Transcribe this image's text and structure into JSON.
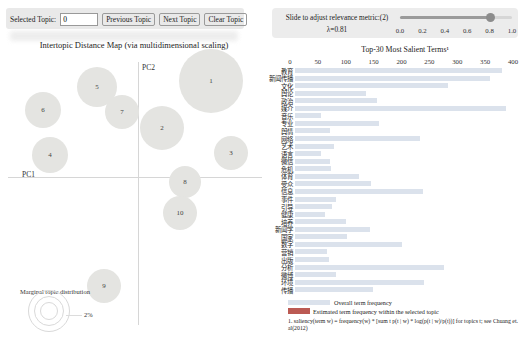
{
  "controls": {
    "selected_topic_label": "Selected Topic:",
    "selected_topic_value": "0",
    "prev_label": "Previous Topic",
    "next_label": "Next Topic",
    "clear_label": "Clear Topic"
  },
  "relevance": {
    "label": "Slide to adjust relevance metric:(2)",
    "lambda": "λ=0.81",
    "value": 0.81,
    "ticks": [
      "0.0",
      "0.2",
      "0.4",
      "0.6",
      "0.8",
      "1.0"
    ]
  },
  "legend": {
    "overall": "Overall term frequency",
    "selected": "Estimated term frequency within the selected topic",
    "overall_color": "#dbe2ec",
    "selected_color": "#bb5a53"
  },
  "footnote": "1. saliency(term w) = frequency(w) * [sum t p(t | w) * log(p(t | w)/p(t))] for topics t; see Chuang et. al(2012)",
  "chart_data": [
    {
      "type": "scatter",
      "title": "Intertopic Distance Map (via multidimensional scaling)",
      "xlabel": "PC1",
      "ylabel": "PC2",
      "marginal_legend_label": "Marginal topic distribution",
      "marginal_legend_tick": "2%",
      "points": [
        {
          "topic": 1,
          "cx": 211,
          "cy": 81,
          "r": 32
        },
        {
          "topic": 2,
          "cx": 162,
          "cy": 128,
          "r": 22
        },
        {
          "topic": 3,
          "cx": 231,
          "cy": 153,
          "r": 17
        },
        {
          "topic": 4,
          "cx": 50,
          "cy": 155,
          "r": 18
        },
        {
          "topic": 5,
          "cx": 97,
          "cy": 87,
          "r": 20
        },
        {
          "topic": 6,
          "cx": 43,
          "cy": 110,
          "r": 18
        },
        {
          "topic": 7,
          "cx": 122,
          "cy": 112,
          "r": 17
        },
        {
          "topic": 8,
          "cx": 185,
          "cy": 182,
          "r": 16
        },
        {
          "topic": 9,
          "cx": 104,
          "cy": 286,
          "r": 17
        },
        {
          "topic": 10,
          "cx": 180,
          "cy": 213,
          "r": 17
        }
      ]
    },
    {
      "type": "bar",
      "title": "Top-30 Most Salient Terms¹",
      "xlabel": "",
      "ylabel": "",
      "xlim": [
        0,
        400
      ],
      "xticks": [
        0,
        50,
        100,
        150,
        200,
        250,
        300,
        350,
        400
      ],
      "legend_position": "bottom",
      "categories": [
        "教育",
        "新闻传播",
        "文化",
        "舆论",
        "政治",
        "媒介",
        "音乐",
        "专业",
        "舆情",
        "网络",
        "艺术",
        "语言",
        "微信",
        "危机",
        "体育",
        "受众",
        "信息",
        "事件",
        "引导",
        "健康",
        "培养",
        "新闻学",
        "国家",
        "数字",
        "营销",
        "出版",
        "分析",
        "微博",
        "环境",
        "传播"
      ],
      "values": [
        380,
        358,
        280,
        130,
        150,
        388,
        48,
        155,
        65,
        230,
        72,
        48,
        64,
        66,
        117,
        140,
        235,
        75,
        68,
        55,
        93,
        138,
        95,
        197,
        59,
        63,
        274,
        75,
        237,
        143
      ]
    }
  ]
}
